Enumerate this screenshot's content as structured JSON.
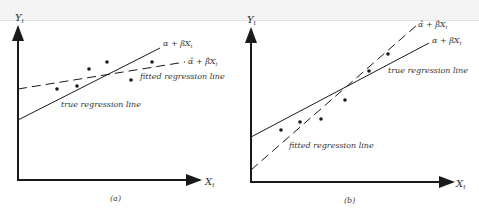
{
  "panels": [
    {
      "id": "a",
      "caption": "(a)",
      "y_axis_label": "Y",
      "y_axis_sub": "t",
      "x_axis_label": "X",
      "x_axis_sub": "t",
      "true_line_formula": "α + βX",
      "true_line_formula_sub": "t",
      "fitted_line_formula": "α̂ + β̂X",
      "fitted_line_formula_sub": "t",
      "true_line_label": "true regression line",
      "fitted_line_label": "fitted regression line"
    },
    {
      "id": "b",
      "caption": "(b)",
      "y_axis_label": "Y",
      "y_axis_sub": "t",
      "x_axis_label": "X",
      "x_axis_sub": "t",
      "true_line_formula": "α + βX",
      "true_line_formula_sub": "t",
      "fitted_line_formula": "α̂ + β̂X",
      "fitted_line_formula_sub": "t",
      "true_line_label": "true regression line",
      "fitted_line_label": "fitted regression line"
    }
  ],
  "colors": {
    "ink": "#1a1a1a",
    "text": "#333333"
  }
}
